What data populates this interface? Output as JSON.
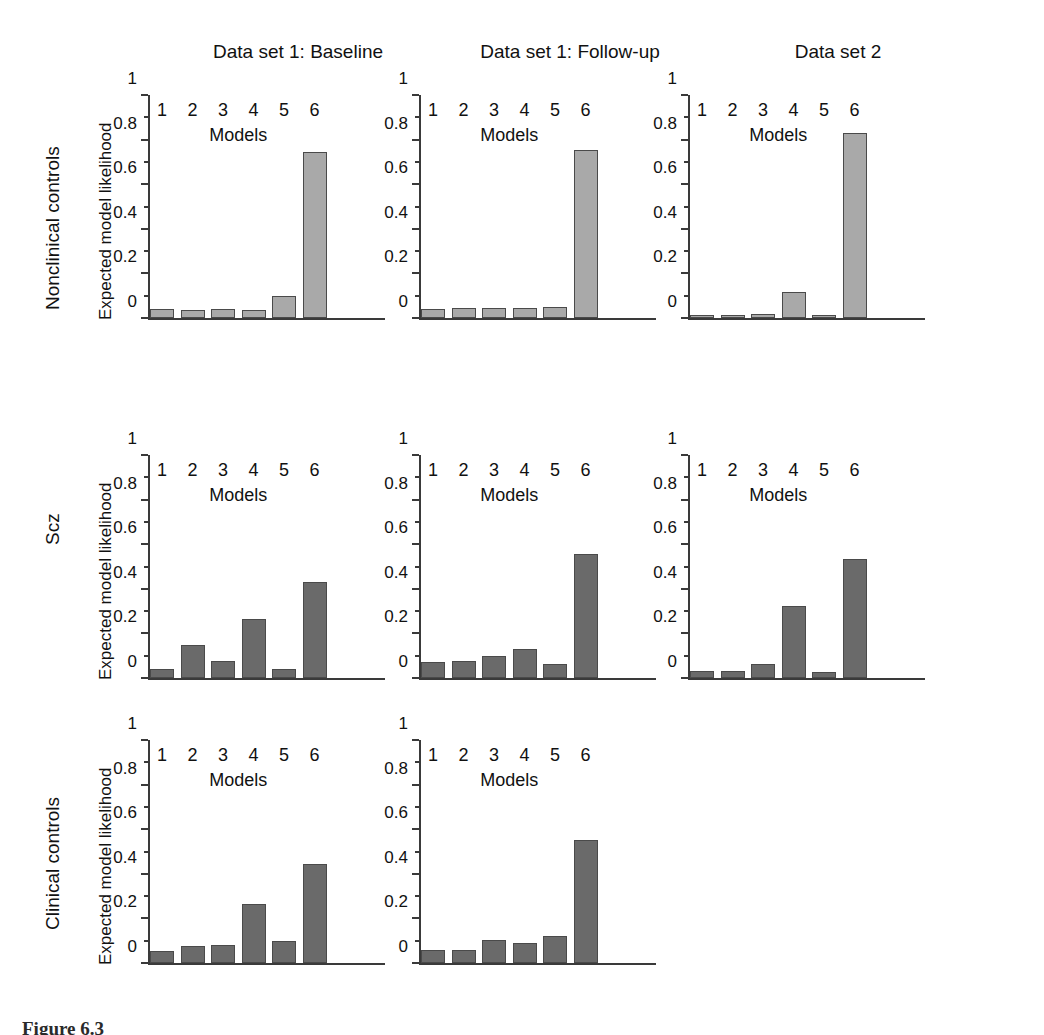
{
  "figure": {
    "caption": "Figure 6.3",
    "row_labels": [
      "Nonclinical controls",
      "Scz",
      "Clinical controls"
    ],
    "column_titles": [
      "Data set 1: Baseline",
      "Data set 1: Follow-up",
      "Data set 2"
    ],
    "axis_title_x": "Models",
    "axis_title_y": "Expected model likelihood",
    "ytick_labels": [
      "0",
      "0.2",
      "0.4",
      "0.6",
      "0.8",
      "1"
    ],
    "xtick_labels": [
      "1",
      "2",
      "3",
      "4",
      "5",
      "6"
    ],
    "colors": {
      "bar_light": "#a9a9a9",
      "bar_dark": "#6a6a6a",
      "bar_edge": "#4a4a4a",
      "axis": "#3a3a3a",
      "text": "#111111",
      "background": "#ffffff"
    }
  },
  "chart_data": [
    {
      "type": "bar",
      "title": "Data set 1: Baseline",
      "row": "Nonclinical controls",
      "xlabel": "Models",
      "ylabel": "Expected model likelihood",
      "categories": [
        "1",
        "2",
        "3",
        "4",
        "5",
        "6"
      ],
      "values": [
        0.04,
        0.035,
        0.04,
        0.035,
        0.1,
        0.745
      ],
      "ylim": [
        0,
        1
      ],
      "yticks": [
        0,
        0.2,
        0.4,
        0.6,
        0.8,
        1
      ],
      "grid": false,
      "legend": "none",
      "bar_color": "#a9a9a9"
    },
    {
      "type": "bar",
      "title": "Data set 1: Follow-up",
      "row": "Nonclinical controls",
      "xlabel": "Models",
      "ylabel": "Expected model likelihood",
      "categories": [
        "1",
        "2",
        "3",
        "4",
        "5",
        "6"
      ],
      "values": [
        0.04,
        0.047,
        0.047,
        0.047,
        0.05,
        0.752
      ],
      "ylim": [
        0,
        1
      ],
      "yticks": [
        0,
        0.2,
        0.4,
        0.6,
        0.8,
        1
      ],
      "grid": false,
      "legend": "none",
      "bar_color": "#a9a9a9"
    },
    {
      "type": "bar",
      "title": "Data set 2",
      "row": "Nonclinical controls",
      "xlabel": "Models",
      "ylabel": "Expected model likelihood",
      "categories": [
        "1",
        "2",
        "3",
        "4",
        "5",
        "6"
      ],
      "values": [
        0.015,
        0.015,
        0.018,
        0.115,
        0.015,
        0.83
      ],
      "ylim": [
        0,
        1
      ],
      "yticks": [
        0,
        0.2,
        0.4,
        0.6,
        0.8,
        1
      ],
      "grid": false,
      "legend": "none",
      "bar_color": "#a9a9a9"
    },
    {
      "type": "bar",
      "title": "Data set 1: Baseline",
      "row": "Scz",
      "xlabel": "Models",
      "ylabel": "Expected model likelihood",
      "categories": [
        "1",
        "2",
        "3",
        "4",
        "5",
        "6"
      ],
      "values": [
        0.04,
        0.148,
        0.075,
        0.265,
        0.04,
        0.43
      ],
      "ylim": [
        0,
        1
      ],
      "yticks": [
        0,
        0.2,
        0.4,
        0.6,
        0.8,
        1
      ],
      "grid": false,
      "legend": "none",
      "bar_color": "#6a6a6a"
    },
    {
      "type": "bar",
      "title": "Data set 1: Follow-up",
      "row": "Scz",
      "xlabel": "Models",
      "ylabel": "Expected model likelihood",
      "categories": [
        "1",
        "2",
        "3",
        "4",
        "5",
        "6"
      ],
      "values": [
        0.07,
        0.078,
        0.1,
        0.13,
        0.065,
        0.558
      ],
      "ylim": [
        0,
        1
      ],
      "yticks": [
        0,
        0.2,
        0.4,
        0.6,
        0.8,
        1
      ],
      "grid": false,
      "legend": "none",
      "bar_color": "#6a6a6a"
    },
    {
      "type": "bar",
      "title": "Data set 2",
      "row": "Scz",
      "xlabel": "Models",
      "ylabel": "Expected model likelihood",
      "categories": [
        "1",
        "2",
        "3",
        "4",
        "5",
        "6"
      ],
      "values": [
        0.03,
        0.03,
        0.065,
        0.325,
        0.025,
        0.535
      ],
      "ylim": [
        0,
        1
      ],
      "yticks": [
        0,
        0.2,
        0.4,
        0.6,
        0.8,
        1
      ],
      "grid": false,
      "legend": "none",
      "bar_color": "#6a6a6a"
    },
    {
      "type": "bar",
      "title": "Data set 1: Baseline",
      "row": "Clinical controls",
      "xlabel": "Models",
      "ylabel": "Expected model likelihood",
      "categories": [
        "1",
        "2",
        "3",
        "4",
        "5",
        "6"
      ],
      "values": [
        0.055,
        0.075,
        0.08,
        0.265,
        0.1,
        0.445
      ],
      "ylim": [
        0,
        1
      ],
      "yticks": [
        0,
        0.2,
        0.4,
        0.6,
        0.8,
        1
      ],
      "grid": false,
      "legend": "none",
      "bar_color": "#6a6a6a"
    },
    {
      "type": "bar",
      "title": "Data set 1: Follow-up",
      "row": "Clinical controls",
      "xlabel": "Models",
      "ylabel": "Expected model likelihood",
      "categories": [
        "1",
        "2",
        "3",
        "4",
        "5",
        "6"
      ],
      "values": [
        0.06,
        0.06,
        0.105,
        0.088,
        0.12,
        0.552
      ],
      "ylim": [
        0,
        1
      ],
      "yticks": [
        0,
        0.2,
        0.4,
        0.6,
        0.8,
        1
      ],
      "grid": false,
      "legend": "none",
      "bar_color": "#6a6a6a"
    }
  ]
}
